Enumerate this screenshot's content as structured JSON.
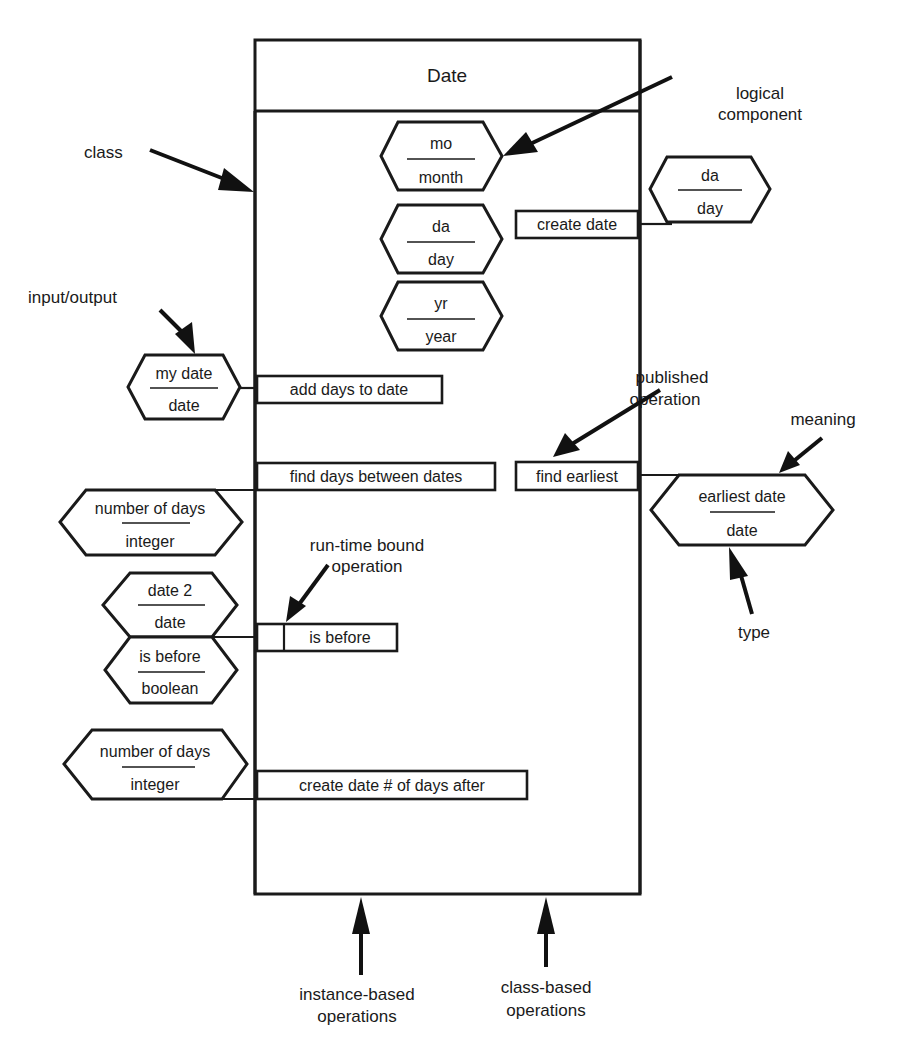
{
  "class": {
    "name": "Date"
  },
  "components": [
    {
      "meaning": "mo",
      "type": "month"
    },
    {
      "meaning": "da",
      "type": "day"
    },
    {
      "meaning": "yr",
      "type": "year"
    }
  ],
  "operations": {
    "create_date": {
      "label": "create date",
      "param": {
        "meaning": "da",
        "type": "day"
      }
    },
    "add_days_to_date": {
      "label": "add days to date",
      "param": {
        "meaning": "my date",
        "type": "date"
      }
    },
    "find_days_between_dates": {
      "label": "find days between dates",
      "param": {
        "meaning": "number of days",
        "type": "integer"
      }
    },
    "find_earliest": {
      "label": "find earliest",
      "param": {
        "meaning": "earliest date",
        "type": "date"
      }
    },
    "is_before": {
      "label": "is before",
      "params": [
        {
          "meaning": "date 2",
          "type": "date"
        },
        {
          "meaning": "is before",
          "type": "boolean"
        }
      ]
    },
    "create_date_days_after": {
      "label": "create date # of days after",
      "param": {
        "meaning": "number of days",
        "type": "integer"
      }
    }
  },
  "annotations": {
    "class": "class",
    "logical_component_1": "logical",
    "logical_component_2": "component",
    "input_output": "input/output",
    "published_operation_1": "published",
    "published_operation_2": "operation",
    "meaning": "meaning",
    "type": "type",
    "run_time_bound_1": "run-time bound",
    "run_time_bound_2": "operation",
    "instance_based_1": "instance-based",
    "instance_based_2": "operations",
    "class_based_1": "class-based",
    "class_based_2": "operations"
  },
  "colors": {
    "ink": "#1a1a1a",
    "background": "#ffffff"
  }
}
